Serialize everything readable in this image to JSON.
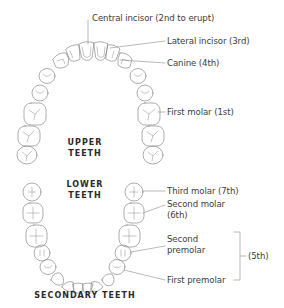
{
  "diagram": {
    "title": "SECONDARY TEETH",
    "upper_heading": [
      "UPPER",
      "TEETH"
    ],
    "lower_heading": [
      "LOWER",
      "TEETH"
    ],
    "labels": {
      "central_incisor": "Central incisor (2nd to erupt)",
      "lateral_incisor": "Lateral incisor (3rd)",
      "canine": "Canine (4th)",
      "first_molar": "First molar (1st)",
      "third_molar": "Third molar (7th)",
      "second_molar_line1": "Second molar",
      "second_molar_line2": "(6th)",
      "second_premolar_line1": "Second",
      "second_premolar_line2": "premolar",
      "first_premolar": "First premolar",
      "premolars_group": "(5th)"
    },
    "colors": {
      "line": "#8a8a8a",
      "text": "#3d3d3d",
      "heading": "#2a2a2a"
    }
  }
}
